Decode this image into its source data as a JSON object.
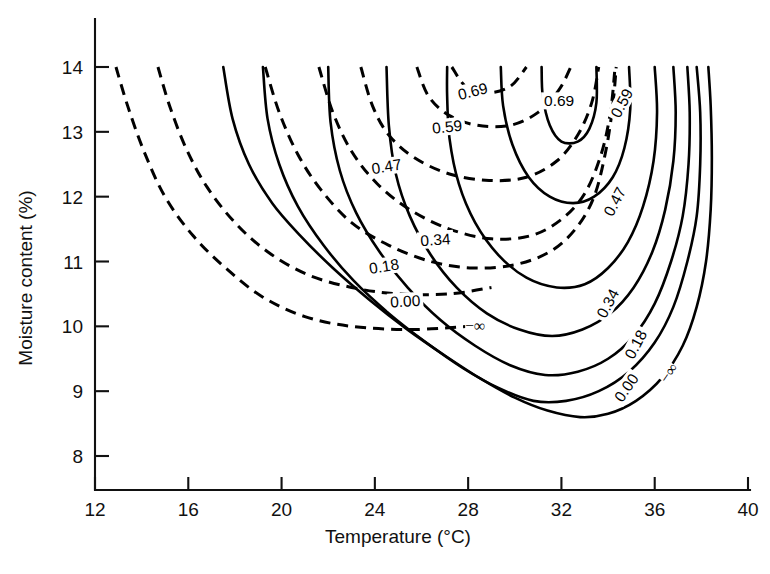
{
  "chart_data": {
    "type": "line",
    "title": "",
    "xlabel": "Temperature (°C)",
    "ylabel": "Moisture content (%)",
    "xlim": [
      12,
      40
    ],
    "ylim": [
      8,
      14
    ],
    "xticks": [
      12,
      16,
      20,
      24,
      28,
      32,
      36,
      40
    ],
    "yticks": [
      8,
      9,
      10,
      11,
      12,
      13,
      14
    ],
    "grid": false,
    "legend": "none",
    "note": "Contour plot: two families of iso-value curves (dashed family on the upper-left, solid family on the lower-right) over Temperature vs Moisture content. Contour levels are labelled in-line along the curves.",
    "contour_levels": [
      "-∞",
      "0.00",
      "0.18",
      "0.34",
      "0.47",
      "0.59",
      "0.69"
    ],
    "series": [
      {
        "name": "dashed -inf",
        "style": "dashed",
        "level": "-∞",
        "points": [
          [
            12.9,
            14.0
          ],
          [
            13.4,
            13.4
          ],
          [
            14.1,
            12.7
          ],
          [
            15.0,
            12.0
          ],
          [
            16.2,
            11.4
          ],
          [
            17.6,
            10.9
          ],
          [
            19.2,
            10.45
          ],
          [
            21.0,
            10.15
          ],
          [
            23.0,
            10.0
          ],
          [
            25.5,
            9.95
          ],
          [
            28.0,
            10.0
          ]
        ]
      },
      {
        "name": "dashed 0.00",
        "style": "dashed",
        "level": "0.00",
        "points": [
          [
            14.7,
            14.0
          ],
          [
            15.2,
            13.4
          ],
          [
            15.9,
            12.75
          ],
          [
            16.8,
            12.15
          ],
          [
            18.0,
            11.6
          ],
          [
            19.4,
            11.15
          ],
          [
            21.1,
            10.8
          ],
          [
            23.0,
            10.6
          ],
          [
            25.0,
            10.5
          ],
          [
            27.2,
            10.5
          ],
          [
            29.0,
            10.6
          ]
        ]
      },
      {
        "name": "dashed 0.18",
        "style": "dashed",
        "level": "0.18",
        "points": [
          [
            19.3,
            14.0
          ],
          [
            19.9,
            13.3
          ],
          [
            20.7,
            12.65
          ],
          [
            21.7,
            12.1
          ],
          [
            23.0,
            11.6
          ],
          [
            24.6,
            11.25
          ],
          [
            26.4,
            11.0
          ],
          [
            28.2,
            10.9
          ],
          [
            30.0,
            10.95
          ],
          [
            31.5,
            11.15
          ],
          [
            32.6,
            11.5
          ],
          [
            33.4,
            12.0
          ],
          [
            33.9,
            12.7
          ],
          [
            34.2,
            13.4
          ],
          [
            34.35,
            14.0
          ]
        ]
      },
      {
        "name": "dashed 0.34",
        "style": "dashed",
        "level": "0.34",
        "points": [
          [
            21.6,
            14.0
          ],
          [
            22.2,
            13.3
          ],
          [
            23.0,
            12.7
          ],
          [
            24.1,
            12.2
          ],
          [
            25.5,
            11.8
          ],
          [
            27.2,
            11.5
          ],
          [
            29.0,
            11.35
          ],
          [
            30.7,
            11.4
          ],
          [
            32.0,
            11.65
          ],
          [
            33.0,
            12.05
          ],
          [
            33.7,
            12.65
          ],
          [
            34.1,
            13.3
          ],
          [
            34.3,
            14.0
          ]
        ]
      },
      {
        "name": "dashed 0.47",
        "style": "dashed",
        "level": "0.47",
        "points": [
          [
            23.4,
            14.0
          ],
          [
            23.9,
            13.4
          ],
          [
            24.6,
            12.95
          ],
          [
            25.7,
            12.6
          ],
          [
            27.2,
            12.35
          ],
          [
            28.9,
            12.25
          ],
          [
            30.5,
            12.3
          ],
          [
            31.8,
            12.55
          ],
          [
            32.7,
            12.95
          ],
          [
            33.3,
            13.45
          ],
          [
            33.6,
            14.0
          ]
        ]
      },
      {
        "name": "dashed 0.59",
        "style": "dashed",
        "level": "0.59",
        "points": [
          [
            25.8,
            14.0
          ],
          [
            26.3,
            13.55
          ],
          [
            27.2,
            13.25
          ],
          [
            28.4,
            13.1
          ],
          [
            29.8,
            13.1
          ],
          [
            31.0,
            13.3
          ],
          [
            31.9,
            13.65
          ],
          [
            32.4,
            14.0
          ]
        ]
      },
      {
        "name": "dashed 0.69",
        "style": "dashed",
        "level": "0.69",
        "points": [
          [
            27.3,
            14.0
          ],
          [
            27.9,
            13.7
          ],
          [
            28.8,
            13.6
          ],
          [
            29.8,
            13.7
          ],
          [
            30.5,
            14.0
          ]
        ]
      },
      {
        "name": "solid -inf",
        "style": "solid",
        "level": "-∞",
        "points": [
          [
            38.3,
            14.0
          ],
          [
            38.4,
            13.4
          ],
          [
            38.45,
            12.6
          ],
          [
            38.4,
            11.8
          ],
          [
            38.2,
            11.0
          ],
          [
            37.8,
            10.3
          ],
          [
            37.2,
            9.7
          ],
          [
            36.3,
            9.2
          ],
          [
            35.2,
            8.85
          ],
          [
            34.0,
            8.65
          ],
          [
            32.8,
            8.6
          ],
          [
            31.4,
            8.7
          ],
          [
            30.0,
            8.9
          ],
          [
            28.5,
            9.2
          ],
          [
            27.0,
            9.55
          ],
          [
            25.4,
            9.95
          ],
          [
            23.8,
            10.4
          ],
          [
            22.2,
            10.9
          ],
          [
            20.8,
            11.4
          ],
          [
            19.6,
            11.9
          ],
          [
            18.6,
            12.5
          ],
          [
            17.9,
            13.2
          ],
          [
            17.5,
            14.0
          ]
        ]
      },
      {
        "name": "solid 0.00",
        "style": "solid",
        "level": "0.00",
        "points": [
          [
            37.8,
            14.0
          ],
          [
            37.95,
            13.3
          ],
          [
            37.95,
            12.5
          ],
          [
            37.8,
            11.7
          ],
          [
            37.4,
            11.0
          ],
          [
            36.8,
            10.3
          ],
          [
            36.0,
            9.75
          ],
          [
            34.9,
            9.3
          ],
          [
            33.6,
            9.0
          ],
          [
            32.2,
            8.85
          ],
          [
            30.8,
            8.85
          ],
          [
            29.3,
            9.05
          ],
          [
            27.8,
            9.35
          ],
          [
            26.2,
            9.75
          ],
          [
            24.6,
            10.2
          ],
          [
            23.1,
            10.7
          ],
          [
            21.8,
            11.25
          ],
          [
            20.7,
            11.85
          ],
          [
            19.9,
            12.5
          ],
          [
            19.4,
            13.2
          ],
          [
            19.2,
            14.0
          ]
        ]
      },
      {
        "name": "solid 0.18",
        "style": "solid",
        "level": "0.18",
        "points": [
          [
            37.4,
            14.0
          ],
          [
            37.5,
            13.3
          ],
          [
            37.45,
            12.5
          ],
          [
            37.2,
            11.7
          ],
          [
            36.7,
            11.0
          ],
          [
            36.0,
            10.35
          ],
          [
            35.1,
            9.85
          ],
          [
            34.0,
            9.5
          ],
          [
            32.7,
            9.3
          ],
          [
            31.3,
            9.25
          ],
          [
            29.8,
            9.4
          ],
          [
            28.3,
            9.7
          ],
          [
            26.8,
            10.1
          ],
          [
            25.4,
            10.6
          ],
          [
            24.2,
            11.15
          ],
          [
            23.2,
            11.75
          ],
          [
            22.5,
            12.4
          ],
          [
            22.1,
            13.15
          ],
          [
            22.0,
            14.0
          ]
        ]
      },
      {
        "name": "solid 0.34",
        "style": "solid",
        "level": "0.34",
        "points": [
          [
            36.8,
            14.0
          ],
          [
            36.9,
            13.3
          ],
          [
            36.8,
            12.55
          ],
          [
            36.45,
            11.8
          ],
          [
            35.9,
            11.15
          ],
          [
            35.1,
            10.6
          ],
          [
            34.1,
            10.2
          ],
          [
            32.9,
            9.95
          ],
          [
            31.6,
            9.85
          ],
          [
            30.2,
            9.95
          ],
          [
            28.8,
            10.2
          ],
          [
            27.5,
            10.6
          ],
          [
            26.4,
            11.1
          ],
          [
            25.5,
            11.7
          ],
          [
            24.9,
            12.35
          ],
          [
            24.6,
            13.1
          ],
          [
            24.5,
            14.0
          ]
        ]
      },
      {
        "name": "solid 0.47",
        "style": "solid",
        "level": "0.47",
        "points": [
          [
            36.0,
            14.0
          ],
          [
            36.1,
            13.3
          ],
          [
            35.95,
            12.55
          ],
          [
            35.5,
            11.85
          ],
          [
            34.85,
            11.3
          ],
          [
            34.0,
            10.9
          ],
          [
            33.0,
            10.65
          ],
          [
            31.8,
            10.6
          ],
          [
            30.5,
            10.75
          ],
          [
            29.3,
            11.1
          ],
          [
            28.3,
            11.6
          ],
          [
            27.6,
            12.2
          ],
          [
            27.2,
            12.9
          ],
          [
            27.1,
            13.55
          ],
          [
            27.1,
            14.0
          ]
        ]
      },
      {
        "name": "solid 0.59",
        "style": "solid",
        "level": "0.59",
        "points": [
          [
            34.9,
            14.0
          ],
          [
            34.95,
            13.35
          ],
          [
            34.7,
            12.75
          ],
          [
            34.2,
            12.3
          ],
          [
            33.4,
            12.0
          ],
          [
            32.5,
            11.9
          ],
          [
            31.5,
            12.0
          ],
          [
            30.6,
            12.3
          ],
          [
            29.9,
            12.8
          ],
          [
            29.5,
            13.4
          ],
          [
            29.4,
            14.0
          ]
        ]
      },
      {
        "name": "solid 0.69",
        "style": "solid",
        "level": "0.69",
        "points": [
          [
            33.5,
            14.0
          ],
          [
            33.5,
            13.45
          ],
          [
            33.2,
            13.05
          ],
          [
            32.7,
            12.85
          ],
          [
            32.0,
            12.85
          ],
          [
            31.5,
            13.1
          ],
          [
            31.2,
            13.55
          ],
          [
            31.15,
            14.0
          ]
        ]
      }
    ],
    "inline_labels": [
      {
        "text": "0.69",
        "x": 28.2,
        "y": 13.62,
        "rotation": -14,
        "family": "dashed-group"
      },
      {
        "text": "0.59",
        "x": 27.1,
        "y": 13.07,
        "rotation": -6,
        "family": "dashed-group"
      },
      {
        "text": "0.47",
        "x": 24.5,
        "y": 12.46,
        "rotation": -9,
        "family": "dashed-group"
      },
      {
        "text": "0.34",
        "x": 26.6,
        "y": 11.33,
        "rotation": -4,
        "family": "dashed-group"
      },
      {
        "text": "0.18",
        "x": 24.4,
        "y": 10.92,
        "rotation": -9,
        "family": "dashed-group"
      },
      {
        "text": "0.00",
        "x": 25.3,
        "y": 10.38,
        "rotation": -3,
        "family": "dashed-group"
      },
      {
        "text": "−∞",
        "x": 28.3,
        "y": 10.0,
        "rotation": 0,
        "family": "dashed-group"
      },
      {
        "text": "0.69",
        "x": 31.9,
        "y": 13.47,
        "rotation": 0,
        "family": "solid-group"
      },
      {
        "text": "0.59",
        "x": 34.6,
        "y": 13.44,
        "rotation": -62,
        "family": "solid-group"
      },
      {
        "text": "0.47",
        "x": 34.3,
        "y": 11.92,
        "rotation": -62,
        "family": "solid-group"
      },
      {
        "text": "0.34",
        "x": 34.0,
        "y": 10.35,
        "rotation": -62,
        "family": "solid-group"
      },
      {
        "text": "0.18",
        "x": 35.2,
        "y": 9.72,
        "rotation": -62,
        "family": "solid-group"
      },
      {
        "text": "0.00",
        "x": 34.8,
        "y": 9.05,
        "rotation": -55,
        "family": "solid-group"
      },
      {
        "text": "−∞",
        "x": 36.6,
        "y": 9.28,
        "rotation": -55,
        "family": "solid-group"
      }
    ]
  },
  "axes": {
    "x_title": "Temperature (°C)",
    "y_title": "Moisture content (%)",
    "x_tick_labels": [
      "12",
      "16",
      "20",
      "24",
      "28",
      "32",
      "36",
      "40"
    ],
    "y_tick_labels": [
      "8",
      "9",
      "10",
      "11",
      "12",
      "13",
      "14"
    ]
  },
  "style": {
    "line_color": "#000000",
    "axis_color": "#111111",
    "background": "#ffffff"
  }
}
